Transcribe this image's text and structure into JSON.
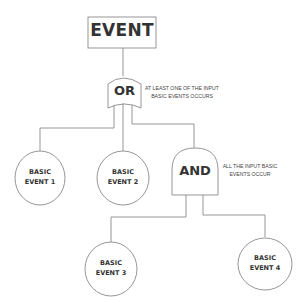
{
  "diagram": {
    "type": "fault-tree",
    "top_event": {
      "label": "EVENT"
    },
    "or_gate": {
      "label": "OR",
      "description_line1": "AT LEAST ONE OF THE INPUT",
      "description_line2": "BASIC EVENTS OCCURS"
    },
    "and_gate": {
      "label": "AND",
      "description_line1": "ALL THE INPUT BASIC",
      "description_line2": "EVENTS OCCUR"
    },
    "basic_events": [
      {
        "line1": "BASIC",
        "line2": "EVENT 1"
      },
      {
        "line1": "BASIC",
        "line2": "EVENT 2"
      },
      {
        "line1": "BASIC",
        "line2": "EVENT 3"
      },
      {
        "line1": "BASIC",
        "line2": "EVENT 4"
      }
    ],
    "colors": {
      "stroke": "#8a8a8a",
      "text": "#333333",
      "background": "#ffffff"
    }
  }
}
